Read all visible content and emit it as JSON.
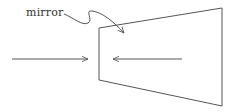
{
  "diagram": {
    "label": "mirror",
    "colors": {
      "stroke": "#555555",
      "text": "#333333",
      "background": "#ffffff"
    },
    "shapes": {
      "trapezoid": {
        "points": "99,28 222,8 222,106 99,80"
      },
      "left_arrow": {
        "from": [
          12,
          59
        ],
        "to": [
          88,
          59
        ],
        "direction": "right"
      },
      "right_arrow": {
        "from": [
          182,
          59
        ],
        "to": [
          113,
          59
        ],
        "direction": "left"
      },
      "pointer": {
        "from": "label",
        "to": "mirror-inner-surface"
      }
    }
  }
}
